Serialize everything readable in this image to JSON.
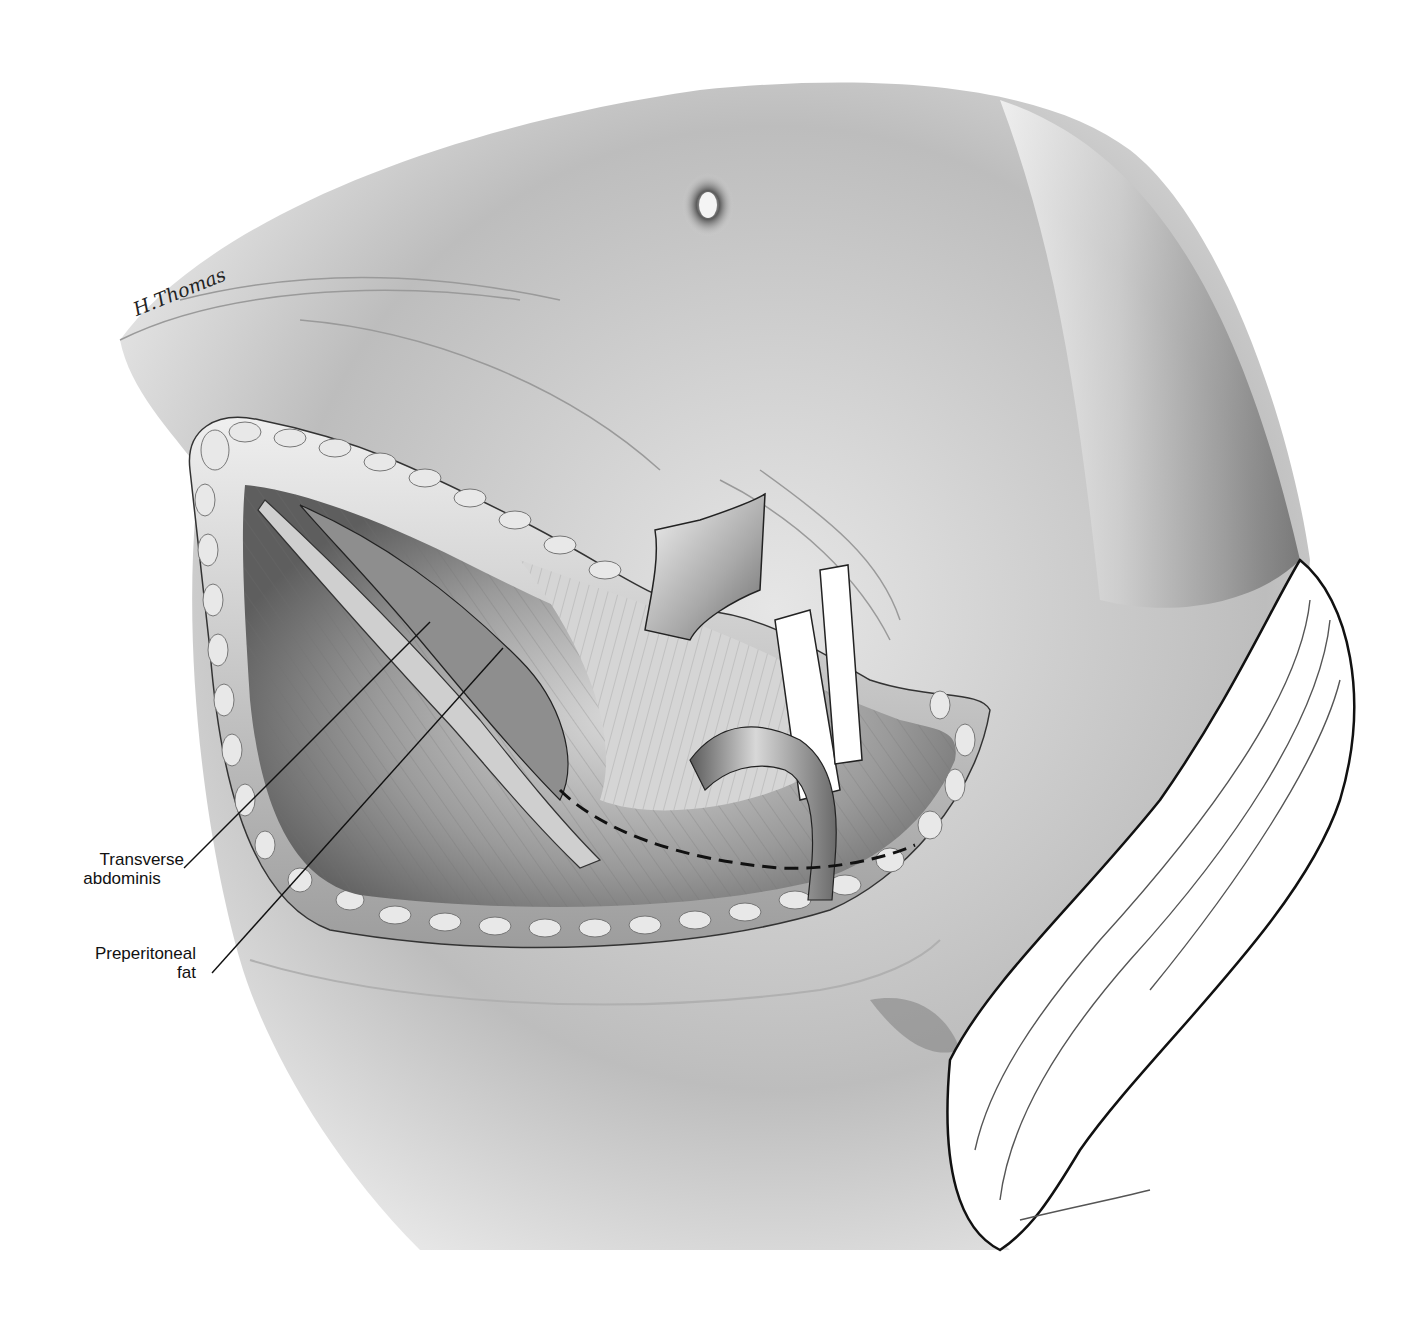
{
  "figure": {
    "type": "surgical-anatomy-illustration",
    "signature": "H.Thomas",
    "colors": {
      "background": "#ffffff",
      "skin_light": "#f2f2f2",
      "skin_mid": "#b8b8b8",
      "skin_dark": "#4a4a4a",
      "tissue": "#8c8c8c",
      "ink": "#111111",
      "drape": "#ffffff"
    }
  },
  "labels": [
    {
      "id": "transverse-abdominis",
      "line1": "Transverse",
      "line2": "abdominis"
    },
    {
      "id": "preperitoneal-fat",
      "line1": "Preperitoneal",
      "line2": "fat"
    }
  ],
  "elements": {
    "umbilicus": "navel",
    "retractor": "retractor-blade",
    "vessel_loops": "vessel-loop-bands",
    "cord_structure": "spermatic-cord",
    "incision_line": "dashed-incision-line",
    "drape": "surgical-drape"
  }
}
